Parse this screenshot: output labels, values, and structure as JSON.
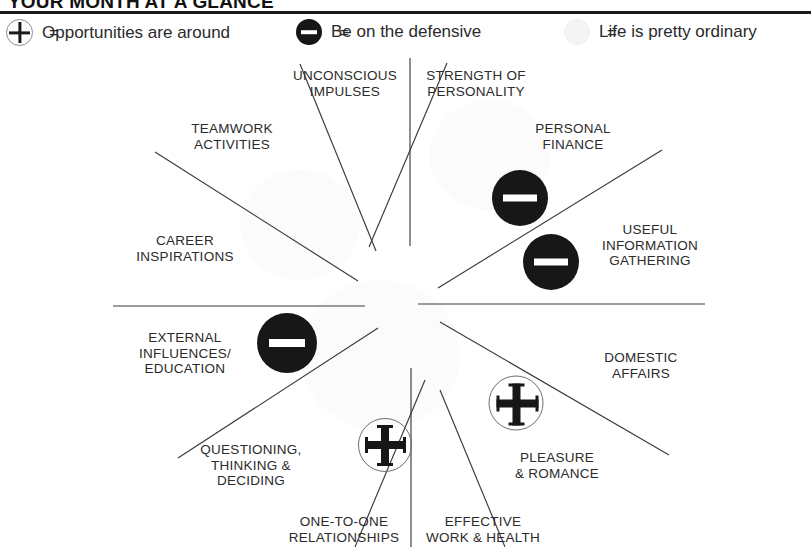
{
  "header": {
    "title": "YOUR MONTH AT A GLANCE"
  },
  "legend": {
    "items": [
      {
        "symbol": "plus-circle-icon",
        "equals": "=",
        "label": "Opportunities are around"
      },
      {
        "symbol": "minus-circle-icon",
        "equals": "=",
        "label": "Be on the defensive"
      },
      {
        "symbol": "neutral-circle-icon",
        "equals": "=",
        "label": "Life is pretty ordinary"
      }
    ]
  },
  "wheel": {
    "center": {
      "x": 405,
      "y": 266
    },
    "sectors": [
      {
        "id": "strength-of-personality",
        "lines": [
          "STRENGTH OF",
          "PERSONALITY"
        ],
        "x": 476,
        "y": 43
      },
      {
        "id": "personal-finance",
        "lines": [
          "PERSONAL",
          "FINANCE"
        ],
        "x": 573,
        "y": 96
      },
      {
        "id": "useful-information-gathering",
        "lines": [
          "USEFUL",
          "INFORMATION",
          "GATHERING"
        ],
        "x": 650,
        "y": 205
      },
      {
        "id": "domestic-affairs",
        "lines": [
          "DOMESTIC",
          "AFFAIRS"
        ],
        "x": 641,
        "y": 325
      },
      {
        "id": "pleasure-and-romance",
        "lines": [
          "PLEASURE",
          "& ROMANCE"
        ],
        "x": 557,
        "y": 425
      },
      {
        "id": "effective-work-and-health",
        "lines": [
          "EFFECTIVE",
          "WORK & HEALTH"
        ],
        "x": 483,
        "y": 489
      },
      {
        "id": "one-to-one-relationships",
        "lines": [
          "ONE-TO-ONE",
          "RELATIONSHIPS"
        ],
        "x": 344,
        "y": 489
      },
      {
        "id": "questioning-thinking-deciding",
        "lines": [
          "QUESTIONING,",
          "THINKING &",
          "DECIDING"
        ],
        "x": 251,
        "y": 425
      },
      {
        "id": "external-influences-education",
        "lines": [
          "EXTERNAL",
          "INFLUENCES/",
          "EDUCATION"
        ],
        "x": 185,
        "y": 313
      },
      {
        "id": "career-inspirations",
        "lines": [
          "CAREER",
          "INSPIRATIONS"
        ],
        "x": 185,
        "y": 208
      },
      {
        "id": "teamwork-activities",
        "lines": [
          "TEAMWORK",
          "ACTIVITIES"
        ],
        "x": 232,
        "y": 96
      },
      {
        "id": "unconscious-impulses",
        "lines": [
          "UNCONSCIOUS",
          "IMPULSES"
        ],
        "x": 345,
        "y": 43
      }
    ],
    "markers": [
      {
        "id": "marker-personal-finance",
        "type": "minus",
        "x": 520,
        "y": 158,
        "size": 56
      },
      {
        "id": "marker-useful-information",
        "type": "minus",
        "x": 551,
        "y": 222,
        "size": 56
      },
      {
        "id": "marker-external-influences",
        "type": "minus",
        "x": 287,
        "y": 303,
        "size": 60
      },
      {
        "id": "marker-pleasure-and-romance",
        "type": "plus",
        "x": 516,
        "y": 363,
        "size": 55
      },
      {
        "id": "marker-one-to-one-relationships",
        "type": "plus",
        "x": 385,
        "y": 405,
        "size": 54
      }
    ],
    "spokes": [
      {
        "id": "spoke-vertical-top",
        "x1": 410,
        "y1": 18,
        "x2": 410,
        "y2": 206
      },
      {
        "id": "spoke-vertical-bottom",
        "x1": 411,
        "y1": 328,
        "x2": 411,
        "y2": 507
      },
      {
        "id": "spoke-horizontal-left",
        "x1": 113,
        "y1": 266,
        "x2": 365,
        "y2": 266
      },
      {
        "id": "spoke-horizontal-right",
        "x1": 418,
        "y1": 264,
        "x2": 705,
        "y2": 264
      },
      {
        "id": "spoke-upper-left-outer",
        "x1": 300,
        "y1": 24,
        "x2": 376,
        "y2": 211
      },
      {
        "id": "spoke-upper-left-inner",
        "x1": 155,
        "y1": 112,
        "x2": 358,
        "y2": 241
      },
      {
        "id": "spoke-upper-right-inner",
        "x1": 447,
        "y1": 23,
        "x2": 369,
        "y2": 207
      },
      {
        "id": "spoke-upper-right-outer",
        "x1": 662,
        "y1": 110,
        "x2": 438,
        "y2": 248
      },
      {
        "id": "spoke-lower-right-outer",
        "x1": 669,
        "y1": 415,
        "x2": 440,
        "y2": 282
      },
      {
        "id": "spoke-lower-right-inner",
        "x1": 505,
        "y1": 507,
        "x2": 440,
        "y2": 350
      },
      {
        "id": "spoke-lower-left-inner",
        "x1": 355,
        "y1": 507,
        "x2": 425,
        "y2": 340
      },
      {
        "id": "spoke-lower-left-outer",
        "x1": 178,
        "y1": 418,
        "x2": 378,
        "y2": 288
      }
    ]
  }
}
